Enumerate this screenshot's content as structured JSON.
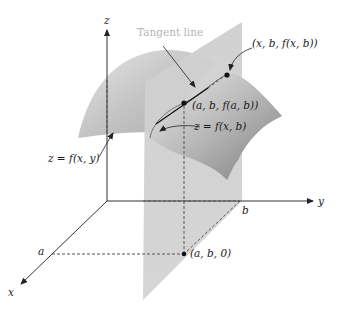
{
  "diagram": {
    "type": "3d-surface-partial-derivative",
    "axes": {
      "x_label": "x",
      "y_label": "y",
      "z_label": "z"
    },
    "tick_labels": {
      "x_tick": "a",
      "y_tick": "b"
    },
    "labels": {
      "tangent_line": "Tangent line",
      "point_xb": "(x, b, f(x, b))",
      "point_ab_fab": "(a, b, f(a, b))",
      "curve": "z = f(x, b)",
      "surface": "z = f(x, y)",
      "point_ab0": "(a, b, 0)"
    },
    "colors": {
      "surface_light": "#d9d9d9",
      "surface_dark": "#8c8c8c",
      "plane": "#cfcfcf",
      "axis": "#333333",
      "tangent_label": "#b5b5b5"
    }
  }
}
